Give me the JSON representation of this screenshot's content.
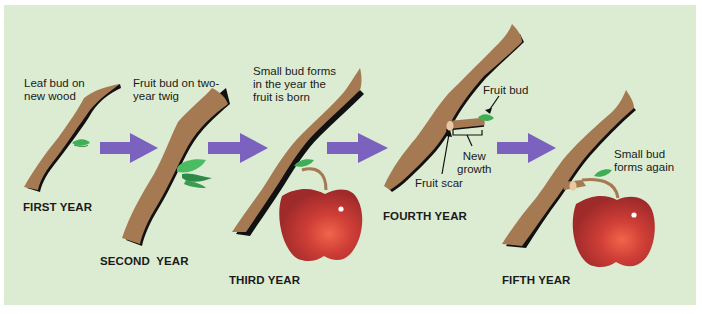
{
  "diagram": {
    "type": "process-sequence",
    "colors": {
      "background": "#dcecd2",
      "branch": "#a57a52",
      "branch_shadow": "#111111",
      "leaf": "#3fae55",
      "arrow": "#7b62bf",
      "apple": "#c43a34"
    },
    "stages": [
      {
        "year_label": "FIRST YEAR",
        "caption": "Leaf bud on\nnew wood"
      },
      {
        "year_label": "SECOND  YEAR",
        "caption": "Fruit bud on two-\n year twig"
      },
      {
        "year_label": "THIRD YEAR",
        "caption": "Small bud forms\nin the year the\nfruit is born"
      },
      {
        "year_label": "FOURTH YEAR",
        "callouts": {
          "fruit_bud": "Fruit bud",
          "new_growth": "New\ngrowth",
          "fruit_scar": "Fruit scar"
        }
      },
      {
        "year_label": "FIFTH YEAR",
        "caption": "Small bud\nforms again"
      }
    ],
    "arrows": [
      "first-to-second",
      "second-to-third",
      "third-to-fourth",
      "fourth-to-fifth"
    ]
  }
}
